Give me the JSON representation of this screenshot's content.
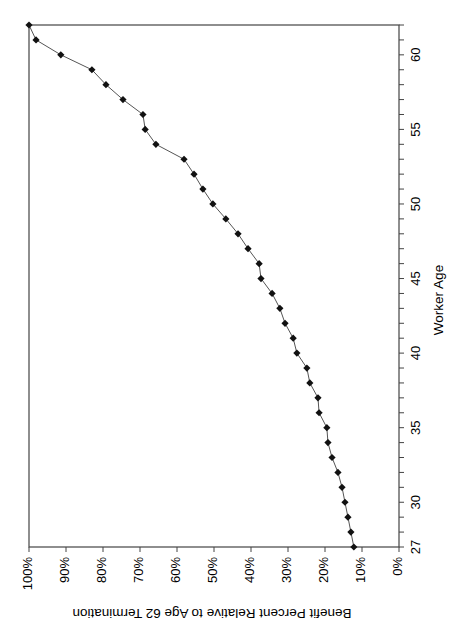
{
  "chart_data": {
    "type": "line",
    "orientation": "rotated-90-clockwise",
    "title": "",
    "xlabel": "Worker Age",
    "ylabel": "Benefit Percent Relative to Age 62 Termination",
    "x_ticks": [
      "27",
      "30",
      "35",
      "40",
      "45",
      "50",
      "55",
      "60"
    ],
    "y_ticks": [
      "0%",
      "10%",
      "20%",
      "30%",
      "40%",
      "50%",
      "60%",
      "70%",
      "80%",
      "90%",
      "100%"
    ],
    "xlim": [
      27,
      62
    ],
    "ylim": [
      0,
      100
    ],
    "grid": false,
    "legend": null,
    "marker": "diamond",
    "series": [
      {
        "name": "Benefit Percent",
        "x": [
          27,
          28,
          29,
          30,
          31,
          32,
          33,
          34,
          35,
          36,
          37,
          38,
          39,
          40,
          41,
          42,
          43,
          44,
          45,
          46,
          47,
          48,
          49,
          50,
          51,
          52,
          53,
          54,
          55,
          56,
          57,
          58,
          59,
          60,
          61,
          62
        ],
        "values": [
          12.2,
          13.0,
          13.8,
          14.6,
          15.4,
          16.5,
          18.1,
          19.2,
          19.5,
          21.6,
          21.9,
          24.1,
          24.9,
          27.6,
          28.6,
          30.8,
          32.2,
          34.3,
          37.3,
          37.8,
          40.8,
          43.5,
          46.8,
          50.3,
          53.0,
          55.4,
          58.1,
          65.7,
          68.6,
          69.2,
          74.6,
          79.2,
          83.0,
          91.4,
          98.1,
          100.0
        ]
      }
    ]
  },
  "colors": {
    "line": "#555555",
    "marker": "#111111",
    "axis": "#444444",
    "background": "#ffffff"
  }
}
